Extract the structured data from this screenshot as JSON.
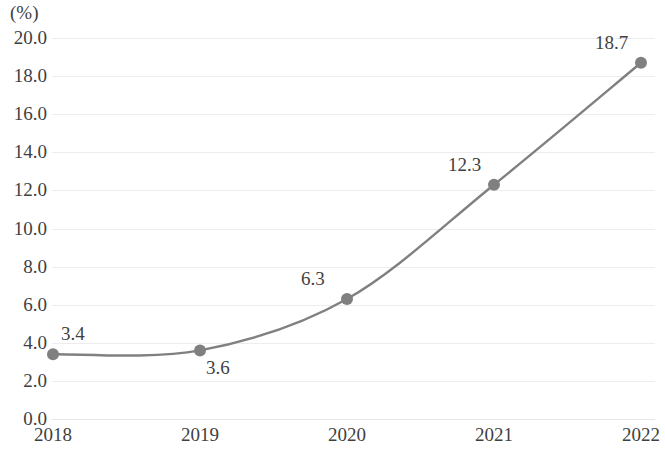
{
  "chart_data": {
    "type": "line",
    "title": "",
    "subtitle": "",
    "xlabel": "",
    "ylabel": "(%)",
    "unit_caption": "(%)",
    "categories": [
      "2018",
      "2019",
      "2020",
      "2021",
      "2022"
    ],
    "x": [
      2018,
      2019,
      2020,
      2021,
      2022
    ],
    "values": [
      3.4,
      3.6,
      6.3,
      12.3,
      18.7
    ],
    "point_labels": [
      "3.4",
      "3.6",
      "6.3",
      "12.3",
      "18.7"
    ],
    "point_label_positions": [
      "above",
      "below",
      "above-left",
      "above-left",
      "above-left"
    ],
    "series": [
      {
        "name": "",
        "values": [
          3.4,
          3.6,
          6.3,
          12.3,
          18.7
        ],
        "line_color": "#808080",
        "marker_color": "#808080",
        "marker_shape": "circle",
        "smooth": true
      }
    ],
    "ylim": [
      0.0,
      20.0
    ],
    "ytick_step": 2.0,
    "ytick_labels": [
      "20.0",
      "18.0",
      "16.0",
      "14.0",
      "12.0",
      "10.0",
      "8.0",
      "6.0",
      "4.0",
      "2.0",
      "0.0"
    ],
    "ytick_values": [
      20.0,
      18.0,
      16.0,
      14.0,
      12.0,
      10.0,
      8.0,
      6.0,
      4.0,
      2.0,
      0.0
    ],
    "xtick_labels": [
      "2018",
      "2019",
      "2020",
      "2021",
      "2022"
    ],
    "grid": true,
    "grid_axis": "y",
    "grid_color": "#ededf0",
    "legend": false,
    "legend_position": "none",
    "background_color": "#ffffff",
    "text_color": "#3f3f3f"
  }
}
